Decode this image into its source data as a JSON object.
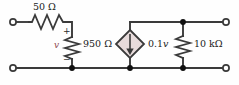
{
  "diagram": {
    "type": "electrical-circuit-schematic",
    "background_color": "#fefefe",
    "wire_color": "#3a3a3a",
    "node_color": "#111111",
    "source_fill_color": "#e8dcdc",
    "v_label_color": "#8e4a52"
  },
  "components": {
    "series_resistor": {
      "name": "50 ohm series resistor",
      "label": "50 Ω",
      "value": "50",
      "unit": "Ω",
      "orientation": "horizontal"
    },
    "shunt_resistor": {
      "name": "950 ohm shunt resistor",
      "label": "950 Ω",
      "value": "950",
      "unit": "Ω",
      "orientation": "vertical",
      "polarity_plus": "+",
      "polarity_minus": "−",
      "voltage_label": "v"
    },
    "dependent_source": {
      "name": "current controlled dependent current source",
      "label": "0.1",
      "label_variable": "v",
      "full_label": "0.1v",
      "shape": "diamond",
      "arrow_direction": "down"
    },
    "load_resistor": {
      "name": "10 kilohm load resistor",
      "label": "10 kΩ",
      "value": "10",
      "unit": "kΩ",
      "orientation": "vertical"
    }
  },
  "terminals": [
    {
      "name": "input-terminal-top-left",
      "position": "top-left"
    },
    {
      "name": "input-terminal-bottom-left",
      "position": "bottom-left"
    },
    {
      "name": "output-terminal-top-right",
      "position": "top-right"
    },
    {
      "name": "output-terminal-bottom-right",
      "position": "bottom-right"
    }
  ],
  "nodes": [
    {
      "name": "node-shunt-bottom"
    },
    {
      "name": "node-source-bottom"
    },
    {
      "name": "node-load-bottom"
    },
    {
      "name": "node-load-top"
    }
  ]
}
